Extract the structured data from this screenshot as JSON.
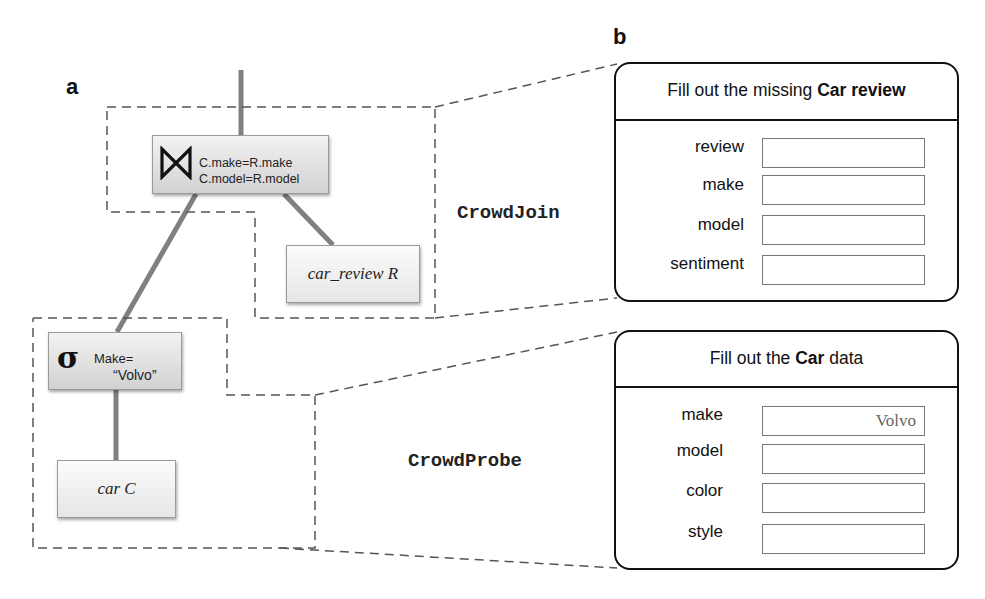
{
  "panels": {
    "a": {
      "label": "a"
    },
    "b": {
      "label": "b"
    }
  },
  "query_plan": {
    "join": {
      "symbol": "join-bowtie",
      "conditions": [
        "C.make=R.make",
        "C.model=R.model"
      ]
    },
    "select": {
      "symbol": "σ",
      "condition_line1": "Make=",
      "condition_line2": "“Volvo”"
    },
    "relations": {
      "car_review": "car_review R",
      "car": "car C"
    }
  },
  "operators": {
    "crowd_join": "CrowdJoin",
    "crowd_probe": "CrowdProbe"
  },
  "forms": [
    {
      "title_prefix": "Fill out the missing ",
      "title_bold": "Car review",
      "title_suffix": "",
      "fields": [
        {
          "label": "review",
          "value": ""
        },
        {
          "label": "make",
          "value": ""
        },
        {
          "label": "model",
          "value": ""
        },
        {
          "label": "sentiment",
          "value": ""
        }
      ]
    },
    {
      "title_prefix": "Fill out the ",
      "title_bold": "Car",
      "title_suffix": " data",
      "fields": [
        {
          "label": "make",
          "value": "Volvo"
        },
        {
          "label": "model",
          "value": ""
        },
        {
          "label": "color",
          "value": ""
        },
        {
          "label": "style",
          "value": ""
        }
      ]
    }
  ],
  "colors": {
    "edge": "#808080",
    "dash": "#555555",
    "form_border": "#111111"
  }
}
